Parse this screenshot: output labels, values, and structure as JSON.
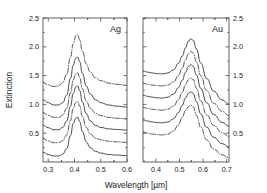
{
  "figure": {
    "axis": {
      "ylabel": "Extinction",
      "xlabel": "Wavelength [µm]"
    },
    "panels": [
      {
        "id": "ag",
        "title": "Ag",
        "xticks": [
          "0.3",
          "0.4",
          "0.5",
          "0.6"
        ],
        "xtick_values": [
          0.3,
          0.4,
          0.5,
          0.6
        ],
        "yticks": [
          "0.5",
          "1.0",
          "1.5",
          "2.0",
          "2.5"
        ],
        "ytick_values": [
          0.5,
          1.0,
          1.5,
          2.0,
          2.5
        ],
        "ytick_side": "left",
        "xlim": [
          0.28,
          0.6
        ],
        "ylim": [
          0.0,
          2.5
        ]
      },
      {
        "id": "au",
        "title": "Au",
        "xticks": [
          "0.4",
          "0.5",
          "0.6",
          "0.7"
        ],
        "xtick_values": [
          0.4,
          0.5,
          0.6,
          0.7
        ],
        "yticks": [
          "0.5",
          "1.0",
          "1.5",
          "2.0",
          "2.5"
        ],
        "ytick_values": [
          0.5,
          1.0,
          1.5,
          2.0,
          2.5
        ],
        "ytick_side": "right",
        "xlim": [
          0.345,
          0.71
        ],
        "ylim": [
          0.0,
          2.5
        ]
      }
    ]
  },
  "chart_data": [
    {
      "type": "line",
      "panel": "Ag",
      "title": "Ag",
      "xlabel": "Wavelength [µm]",
      "ylabel": "Extinction",
      "xlim": [
        0.28,
        0.6
      ],
      "ylim": [
        0.0,
        2.5
      ],
      "xticks": [
        0.3,
        0.4,
        0.5,
        0.6
      ],
      "yticks": [
        0.5,
        1.0,
        1.5,
        2.0,
        2.5
      ],
      "grid": false,
      "legend": "none",
      "x": [
        0.28,
        0.3,
        0.32,
        0.34,
        0.355,
        0.37,
        0.385,
        0.395,
        0.405,
        0.412,
        0.42,
        0.43,
        0.445,
        0.46,
        0.48,
        0.5,
        0.53,
        0.56,
        0.6
      ],
      "series": [
        {
          "name": "curve-1",
          "style": "dash-dot",
          "offset": 1.25,
          "peak_x": 0.415,
          "peak_y": 2.21,
          "values": [
            1.38,
            1.34,
            1.31,
            1.32,
            1.38,
            1.52,
            1.82,
            2.05,
            2.19,
            2.21,
            2.12,
            1.92,
            1.7,
            1.56,
            1.46,
            1.41,
            1.37,
            1.35,
            1.33
          ]
        },
        {
          "name": "curve-2",
          "style": "solid",
          "offset": 1.0,
          "peak_x": 0.412,
          "peak_y": 1.82,
          "values": [
            1.08,
            1.03,
            0.99,
            0.99,
            1.03,
            1.16,
            1.45,
            1.68,
            1.8,
            1.82,
            1.74,
            1.54,
            1.32,
            1.18,
            1.08,
            1.03,
            0.99,
            0.97,
            0.955
          ]
        },
        {
          "name": "curve-3",
          "style": "dash-dot",
          "offset": 0.78,
          "peak_x": 0.41,
          "peak_y": 1.55,
          "values": [
            0.86,
            0.81,
            0.775,
            0.775,
            0.815,
            0.93,
            1.2,
            1.42,
            1.53,
            1.55,
            1.47,
            1.27,
            1.06,
            0.93,
            0.845,
            0.805,
            0.775,
            0.76,
            0.75
          ]
        },
        {
          "name": "curve-4",
          "style": "solid",
          "offset": 0.56,
          "peak_x": 0.408,
          "peak_y": 1.32,
          "values": [
            0.64,
            0.595,
            0.56,
            0.56,
            0.6,
            0.71,
            0.97,
            1.19,
            1.3,
            1.32,
            1.24,
            1.04,
            0.84,
            0.715,
            0.635,
            0.6,
            0.575,
            0.565,
            0.555
          ]
        },
        {
          "name": "curve-5",
          "style": "dash-dot",
          "offset": 0.33,
          "peak_x": 0.406,
          "peak_y": 1.05,
          "values": [
            0.41,
            0.365,
            0.335,
            0.335,
            0.37,
            0.47,
            0.72,
            0.93,
            1.03,
            1.05,
            0.97,
            0.79,
            0.6,
            0.49,
            0.415,
            0.385,
            0.36,
            0.35,
            0.34
          ]
        },
        {
          "name": "curve-6",
          "style": "solid",
          "offset": 0.1,
          "peak_x": 0.404,
          "peak_y": 0.78,
          "values": [
            0.17,
            0.13,
            0.105,
            0.105,
            0.135,
            0.23,
            0.46,
            0.67,
            0.76,
            0.78,
            0.7,
            0.53,
            0.35,
            0.25,
            0.185,
            0.155,
            0.13,
            0.12,
            0.11
          ]
        }
      ]
    },
    {
      "type": "line",
      "panel": "Au",
      "title": "Au",
      "xlabel": "Wavelength [µm]",
      "ylabel": "Extinction",
      "xlim": [
        0.345,
        0.71
      ],
      "ylim": [
        0.0,
        2.5
      ],
      "xticks": [
        0.4,
        0.5,
        0.6,
        0.7
      ],
      "yticks": [
        0.5,
        1.0,
        1.5,
        2.0,
        2.5
      ],
      "grid": false,
      "legend": "none",
      "x": [
        0.345,
        0.365,
        0.385,
        0.405,
        0.425,
        0.45,
        0.475,
        0.495,
        0.512,
        0.525,
        0.538,
        0.548,
        0.558,
        0.572,
        0.59,
        0.615,
        0.645,
        0.68,
        0.71
      ],
      "series": [
        {
          "name": "curve-1",
          "style": "solid",
          "offset": 1.22,
          "peak_x": 0.545,
          "peak_y": 2.14,
          "values": [
            1.58,
            1.56,
            1.545,
            1.535,
            1.53,
            1.545,
            1.6,
            1.71,
            1.84,
            1.98,
            2.1,
            2.14,
            2.11,
            1.96,
            1.72,
            1.45,
            1.23,
            1.08,
            1.0
          ]
        },
        {
          "name": "curve-2",
          "style": "dash-dot",
          "offset": 1.02,
          "peak_x": 0.542,
          "peak_y": 1.92,
          "values": [
            1.37,
            1.35,
            1.335,
            1.325,
            1.32,
            1.335,
            1.39,
            1.5,
            1.63,
            1.77,
            1.88,
            1.92,
            1.89,
            1.74,
            1.5,
            1.24,
            1.02,
            0.88,
            0.805
          ]
        },
        {
          "name": "curve-3",
          "style": "solid",
          "offset": 0.82,
          "peak_x": 0.538,
          "peak_y": 1.69,
          "values": [
            1.16,
            1.14,
            1.125,
            1.115,
            1.11,
            1.125,
            1.18,
            1.29,
            1.42,
            1.555,
            1.66,
            1.69,
            1.66,
            1.51,
            1.28,
            1.03,
            0.825,
            0.69,
            0.62
          ]
        },
        {
          "name": "curve-4",
          "style": "dash-dot",
          "offset": 0.62,
          "peak_x": 0.534,
          "peak_y": 1.46,
          "values": [
            0.95,
            0.93,
            0.915,
            0.905,
            0.9,
            0.915,
            0.97,
            1.08,
            1.21,
            1.34,
            1.43,
            1.46,
            1.43,
            1.28,
            1.06,
            0.82,
            0.635,
            0.51,
            0.445
          ]
        },
        {
          "name": "curve-5",
          "style": "solid",
          "offset": 0.4,
          "peak_x": 0.53,
          "peak_y": 1.22,
          "values": [
            0.73,
            0.71,
            0.695,
            0.685,
            0.68,
            0.695,
            0.75,
            0.855,
            0.985,
            1.11,
            1.19,
            1.22,
            1.19,
            1.045,
            0.835,
            0.605,
            0.43,
            0.32,
            0.26
          ]
        },
        {
          "name": "curve-6",
          "style": "dash-dot",
          "offset": 0.19,
          "peak_x": 0.527,
          "peak_y": 0.99,
          "values": [
            0.52,
            0.5,
            0.485,
            0.475,
            0.47,
            0.485,
            0.54,
            0.645,
            0.775,
            0.895,
            0.96,
            0.99,
            0.955,
            0.81,
            0.605,
            0.385,
            0.225,
            0.125,
            0.075
          ]
        }
      ]
    }
  ]
}
